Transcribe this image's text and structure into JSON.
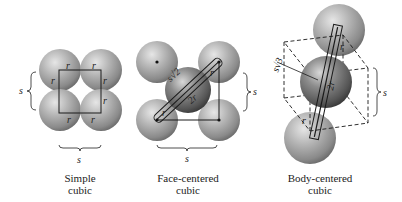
{
  "panels": [
    {
      "id": "simple-cubic",
      "caption_line1": "Simple",
      "caption_line2": "cubic",
      "side_label": "s",
      "bottom_label": "s",
      "radius_label": "r"
    },
    {
      "id": "face-centered-cubic",
      "caption_line1": "Face-centered",
      "caption_line2": "cubic",
      "side_label": "s",
      "bottom_label": "s",
      "radius_label": "r",
      "diagonal_label": "s√2",
      "diameter_label": "2r"
    },
    {
      "id": "body-centered-cubic",
      "caption_line1": "Body-centered",
      "caption_line2": "cubic",
      "side_label": "s",
      "radius_label": "r",
      "diagonal_label": "s√3",
      "diameter_label": "2r"
    }
  ],
  "colors": {
    "sphere_light": "#d6d6d6",
    "sphere_mid": "#a8a8a8",
    "sphere_dark": "#6e6e6e",
    "center_sphere_dark": "#4a4a4a",
    "line": "#1a1a1a"
  }
}
